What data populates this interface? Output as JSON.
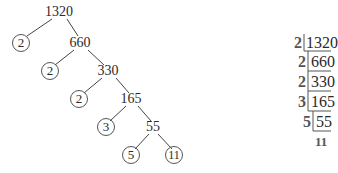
{
  "factor_tree": {
    "root": "1320",
    "nodes": [
      {
        "id": "n1320",
        "value": "1320",
        "x": 59,
        "y": 12,
        "prime": false
      },
      {
        "id": "p2a",
        "value": "2",
        "x": 21,
        "y": 43,
        "prime": true
      },
      {
        "id": "n660",
        "value": "660",
        "x": 80,
        "y": 43,
        "prime": false
      },
      {
        "id": "p2b",
        "value": "2",
        "x": 50,
        "y": 71,
        "prime": true
      },
      {
        "id": "n330",
        "value": "330",
        "x": 108,
        "y": 71,
        "prime": false
      },
      {
        "id": "p2c",
        "value": "2",
        "x": 79,
        "y": 99,
        "prime": true
      },
      {
        "id": "n165",
        "value": "165",
        "x": 131,
        "y": 99,
        "prime": false
      },
      {
        "id": "p3",
        "value": "3",
        "x": 106,
        "y": 127,
        "prime": true
      },
      {
        "id": "n55",
        "value": "55",
        "x": 153,
        "y": 127,
        "prime": false
      },
      {
        "id": "p5",
        "value": "5",
        "x": 131,
        "y": 155,
        "prime": true
      },
      {
        "id": "p11",
        "value": "11",
        "x": 174,
        "y": 155,
        "prime": true
      }
    ],
    "edges": [
      [
        "n1320",
        "p2a"
      ],
      [
        "n1320",
        "n660"
      ],
      [
        "n660",
        "p2b"
      ],
      [
        "n660",
        "n330"
      ],
      [
        "n330",
        "p2c"
      ],
      [
        "n330",
        "n165"
      ],
      [
        "n165",
        "p3"
      ],
      [
        "n165",
        "n55"
      ],
      [
        "n55",
        "p5"
      ],
      [
        "n55",
        "p11"
      ]
    ]
  },
  "ladder": {
    "rows": [
      {
        "divisor": "2",
        "dividend": "1320"
      },
      {
        "divisor": "2",
        "dividend": "660"
      },
      {
        "divisor": "2",
        "dividend": "330"
      },
      {
        "divisor": "3",
        "dividend": "165"
      },
      {
        "divisor": "5",
        "dividend": "55"
      }
    ],
    "final": "11"
  }
}
